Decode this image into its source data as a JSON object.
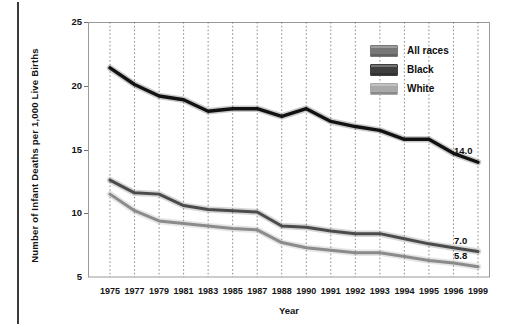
{
  "chart_data": {
    "type": "line",
    "title": "",
    "xlabel": "Year",
    "ylabel": "Number of Infant Deaths per 1,000 Live Births",
    "xlim": [
      1975,
      1999
    ],
    "ylim": [
      5,
      25
    ],
    "yticks": [
      5,
      10,
      15,
      20,
      25
    ],
    "xticks": [
      "1975",
      "1977",
      "1979",
      "1981",
      "1983",
      "1985",
      "1987",
      "1988",
      "1990",
      "1991",
      "1992",
      "1993",
      "1994",
      "1995",
      "1996",
      "1999"
    ],
    "grid": "vertical-dotted",
    "legend_position": "top-right",
    "x_categories": [
      "1975",
      "1977",
      "1979",
      "1981",
      "1983",
      "1985",
      "1987",
      "1988",
      "1990",
      "1991",
      "1992",
      "1993",
      "1994",
      "1995",
      "1996",
      "1999"
    ],
    "series": [
      {
        "name": "Black",
        "color": "#121212",
        "values": [
          21.4,
          20.1,
          19.2,
          18.9,
          18.0,
          18.2,
          18.2,
          17.6,
          18.2,
          17.2,
          16.8,
          16.5,
          15.8,
          15.8,
          14.7,
          14.0
        ],
        "end_label": "14.0"
      },
      {
        "name": "All races",
        "color": "#4b4b4b",
        "values": [
          12.6,
          11.6,
          11.5,
          10.6,
          10.3,
          10.2,
          10.1,
          9.0,
          8.9,
          8.6,
          8.4,
          8.4,
          8.0,
          7.6,
          7.3,
          7.0
        ],
        "end_label": "7.0"
      },
      {
        "name": "White",
        "color": "#8b8b8b",
        "values": [
          11.5,
          10.2,
          9.4,
          9.2,
          9.0,
          8.8,
          8.7,
          7.7,
          7.3,
          7.1,
          6.9,
          6.9,
          6.6,
          6.3,
          6.1,
          5.8
        ],
        "end_label": "5.8"
      }
    ]
  },
  "axes": {
    "ylabel": "Number of Infant Deaths per 1,000 Live Births",
    "xlabel": "Year",
    "yticks": [
      "25",
      "20",
      "15",
      "10",
      "5"
    ],
    "xticks": [
      "1975",
      "1977",
      "1979",
      "1981",
      "1983",
      "1985",
      "1987",
      "1988",
      "1990",
      "1991",
      "1992",
      "1993",
      "1994",
      "1995",
      "1996",
      "1999"
    ]
  },
  "legend": {
    "items": [
      {
        "label": "All races",
        "color": "#787878"
      },
      {
        "label": "Black",
        "color": "#3f3f3f"
      },
      {
        "label": "White",
        "color": "#a9a9a9"
      }
    ]
  },
  "end_labels": [
    {
      "label": "14.0",
      "series": "Black"
    },
    {
      "label": "7.0",
      "series": "All races"
    },
    {
      "label": "5.8",
      "series": "White"
    }
  ]
}
